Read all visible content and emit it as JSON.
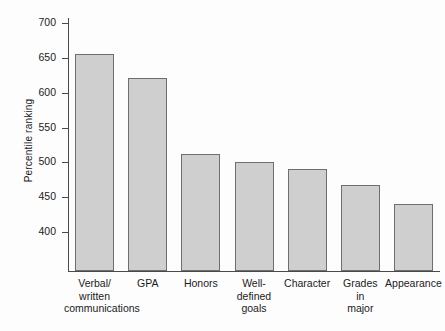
{
  "chart_data": {
    "type": "bar",
    "title": "",
    "xlabel": "",
    "ylabel": "Percentile ranking",
    "ylim": [
      370,
      715
    ],
    "grid": false,
    "legend": false,
    "categories": [
      "Verbal/ written communications",
      "GPA",
      "Honors",
      "Well- defined goals",
      "Character",
      "Grades in major",
      "Appearance"
    ],
    "category_lines": [
      [
        "Verbal/",
        "written",
        "communications"
      ],
      [
        "GPA"
      ],
      [
        "Honors"
      ],
      [
        "Well-",
        "defined",
        "goals"
      ],
      [
        "Character"
      ],
      [
        "Grades",
        "in",
        "major"
      ],
      [
        "Appearance"
      ]
    ],
    "values": [
      655,
      621,
      512,
      500,
      490,
      468,
      440
    ],
    "yticks": [
      400,
      450,
      500,
      550,
      600,
      650,
      700
    ],
    "ytick_labels": [
      "400",
      "450",
      "500",
      "550",
      "600",
      "650",
      "700"
    ],
    "bar_fill_color": "#cfcfcf",
    "bar_border_color": "#6e6e6e",
    "axis_color": "#4a4a4a",
    "background_color": "#fdfdfd"
  }
}
